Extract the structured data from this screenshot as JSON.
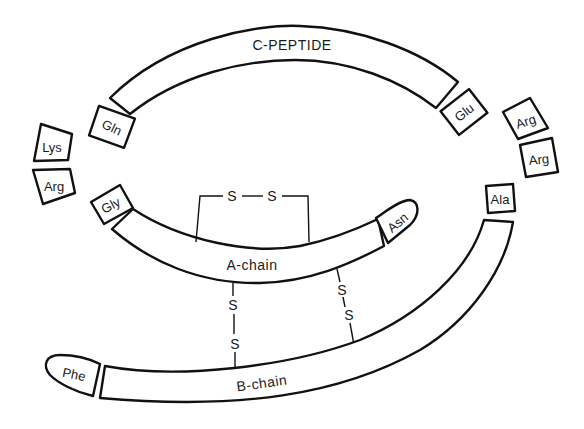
{
  "segments": {
    "c_peptide": "C-PEPTIDE",
    "a_chain": "A-chain",
    "b_chain": "B-chain"
  },
  "residues": {
    "gln": "Gln",
    "glu": "Glu",
    "lys": "Lys",
    "arg_left": "Arg",
    "arg_right_1": "Arg",
    "arg_right_2": "Arg",
    "ala": "Ala",
    "gly": "Gly",
    "asn": "Asn",
    "phe": "Phe"
  },
  "disulfide": {
    "sulfur": "S",
    "intrachain_a": [
      "S",
      "S"
    ],
    "interchain_1": [
      "S",
      "S"
    ],
    "interchain_2": [
      "S",
      "S"
    ]
  },
  "colors": {
    "stroke": "#111111",
    "fill": "#ffffff",
    "text": "#1a1a1a"
  }
}
